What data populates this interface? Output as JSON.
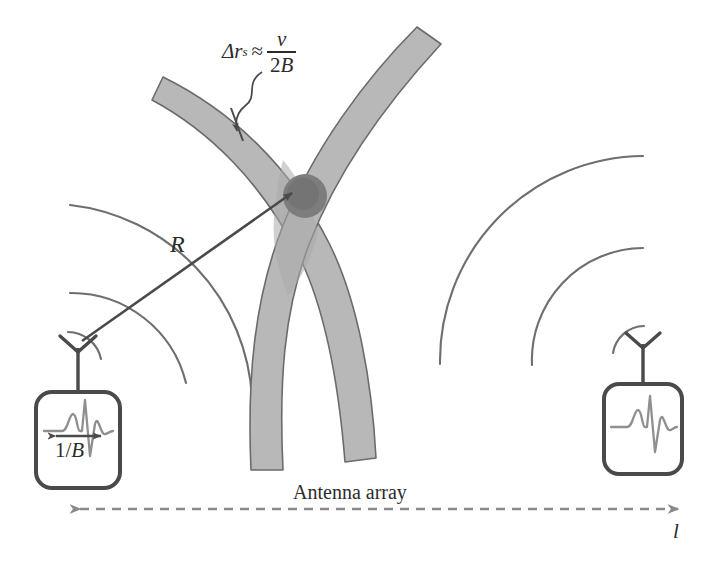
{
  "figure": {
    "background_color": "#ffffff"
  },
  "labels": {
    "resolution_formula": {
      "lhs": "Δr",
      "lhs_subscript": "s",
      "relation": "≈",
      "numerator": "v",
      "denominator_coefficient": "2",
      "denominator_variable": "B",
      "plain": "Δr_s ≈ v / 2B"
    },
    "range": "R",
    "pulse_width": "1/B",
    "pulse_width_numerator": "1",
    "pulse_width_denominator": "B",
    "antenna_array": "Antenna array",
    "baseline_length": "l"
  },
  "colors": {
    "band_fill": "#b8b8b8",
    "band_stroke": "#6b6b6b",
    "target_blob": "#7d7d7d",
    "wavefront": "#6e6e6e",
    "ink": "#4a4a4a",
    "text": "#2b2b2b",
    "dashed_axis": "#8a8a8a"
  },
  "elements": {
    "resolution_bands": [
      {
        "name": "left-range-cell-band",
        "description": "gray curved band descending from upper-left through the crossing point toward lower-center"
      },
      {
        "name": "right-range-cell-band",
        "description": "gray curved band descending from top-center-right through the crossing point toward lower-center"
      }
    ],
    "target": {
      "name": "target-blob",
      "description": "dark gray circular target at band intersection",
      "center_x": 305,
      "center_y": 196,
      "radius": 22
    },
    "antennas": [
      {
        "name": "left-antenna-receiver",
        "box_x": 36,
        "box_y": 392,
        "box_width": 84,
        "box_height": 96,
        "has_pulse_width_marker": true
      },
      {
        "name": "right-antenna-receiver",
        "box_x": 604,
        "box_y": 384,
        "box_width": 78,
        "box_height": 90,
        "has_pulse_width_marker": false
      }
    ],
    "wavefront_arc_counts": {
      "left_antenna": 3,
      "right_antenna": 3
    },
    "range_arrow": {
      "name": "range-arrow",
      "from_x": 82,
      "from_y": 341,
      "to_x": 292,
      "to_y": 193
    },
    "baseline_arrow": {
      "name": "baseline-arrow",
      "from_x": 68,
      "from_y": 509,
      "to_x": 690,
      "to_y": 509,
      "style": "dashed double-headed"
    }
  }
}
